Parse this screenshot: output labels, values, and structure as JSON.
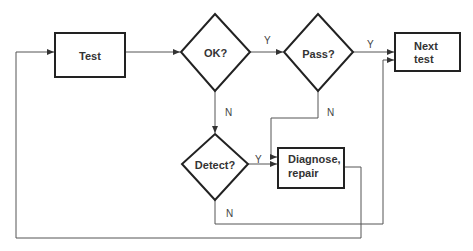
{
  "diagram": {
    "type": "flowchart",
    "colors": {
      "line": "#555555",
      "border": "#222222",
      "text": "#333333",
      "background": "#ffffff"
    },
    "nodes": [
      {
        "id": "test",
        "shape": "rectangle",
        "label": "Test"
      },
      {
        "id": "ok",
        "shape": "diamond",
        "label": "OK?"
      },
      {
        "id": "pass",
        "shape": "diamond",
        "label": "Pass?"
      },
      {
        "id": "next",
        "shape": "rectangle",
        "label_line1": "Next",
        "label_line2": "test"
      },
      {
        "id": "detect",
        "shape": "diamond",
        "label": "Detect?"
      },
      {
        "id": "diagnose",
        "shape": "rectangle",
        "label_line1": "Diagnose,",
        "label_line2": "repair"
      }
    ],
    "edges": [
      {
        "from": "test",
        "to": "ok",
        "label": ""
      },
      {
        "from": "ok",
        "to": "pass",
        "label": "Y"
      },
      {
        "from": "ok",
        "to": "detect",
        "label": "N"
      },
      {
        "from": "pass",
        "to": "next",
        "label": "Y"
      },
      {
        "from": "pass",
        "to": "diagnose",
        "label": "N"
      },
      {
        "from": "detect",
        "to": "diagnose",
        "label": "Y"
      },
      {
        "from": "detect",
        "to": "next",
        "label": "N"
      },
      {
        "from": "diagnose",
        "to": "test",
        "label": ""
      }
    ]
  }
}
